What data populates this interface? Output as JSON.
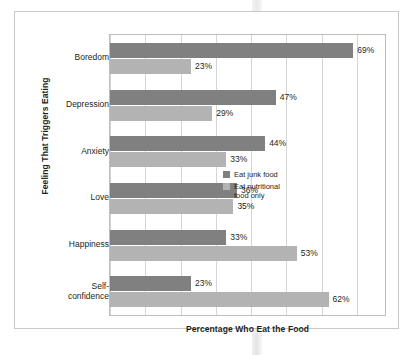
{
  "chart_data": {
    "type": "bar",
    "orientation": "horizontal",
    "title": "",
    "xlabel": "Percentage Who Eat the Food",
    "ylabel": "Feeling That Triggers Eating",
    "categories": [
      "Boredom",
      "Depression",
      "Anxiety",
      "Love",
      "Happiness",
      "Self-confidence"
    ],
    "category_display": [
      "Boredom",
      "Depression",
      "Anxiety",
      "Love",
      "Happiness",
      "Self-\nconfidence"
    ],
    "series": [
      {
        "name": "Eat junk food",
        "color": "#808080",
        "values": [
          69,
          47,
          44,
          36,
          33,
          23
        ],
        "labels": [
          "69%",
          "47%",
          "44%",
          "36%",
          "33%",
          "23%"
        ]
      },
      {
        "name": "Eat nutritional food only",
        "color": "#b3b3b3",
        "values": [
          23,
          29,
          33,
          35,
          53,
          62
        ],
        "labels": [
          "23%",
          "29%",
          "33%",
          "35%",
          "53%",
          "62%"
        ]
      }
    ],
    "xlim": [
      0,
      78
    ],
    "xticks": [
      0,
      10,
      20,
      30,
      40,
      50,
      60,
      70
    ],
    "grid": "vertical",
    "tick_labels_visible": false,
    "legend": {
      "position": "inside-right-middle",
      "entries": [
        {
          "label": "Eat junk food",
          "color": "#808080"
        },
        {
          "label": "Eat nutritional\nfood only",
          "color": "#b3b3b3"
        }
      ]
    }
  },
  "colors": {
    "junk": "#808080",
    "nutritional": "#b3b3b3",
    "gridline": "#d5d5d5",
    "frame": "#c9c9c9",
    "text": "#231f20"
  }
}
